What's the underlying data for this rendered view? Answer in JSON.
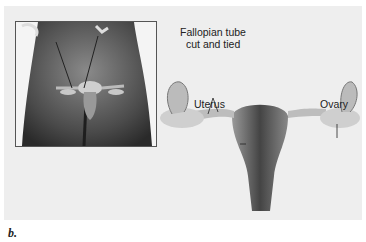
{
  "figure": {
    "caption": "b.",
    "labels": {
      "fallopian_tube_line1": "Fallopian tube",
      "fallopian_tube_line2": "cut and tied",
      "uterus": "Uterus",
      "ovary": "Ovary"
    },
    "colors": {
      "background": "#eeeeee",
      "tissue_light": "#d8d8d8",
      "tissue_dark": "#555555",
      "body_dark": "#3a3a3a"
    }
  }
}
